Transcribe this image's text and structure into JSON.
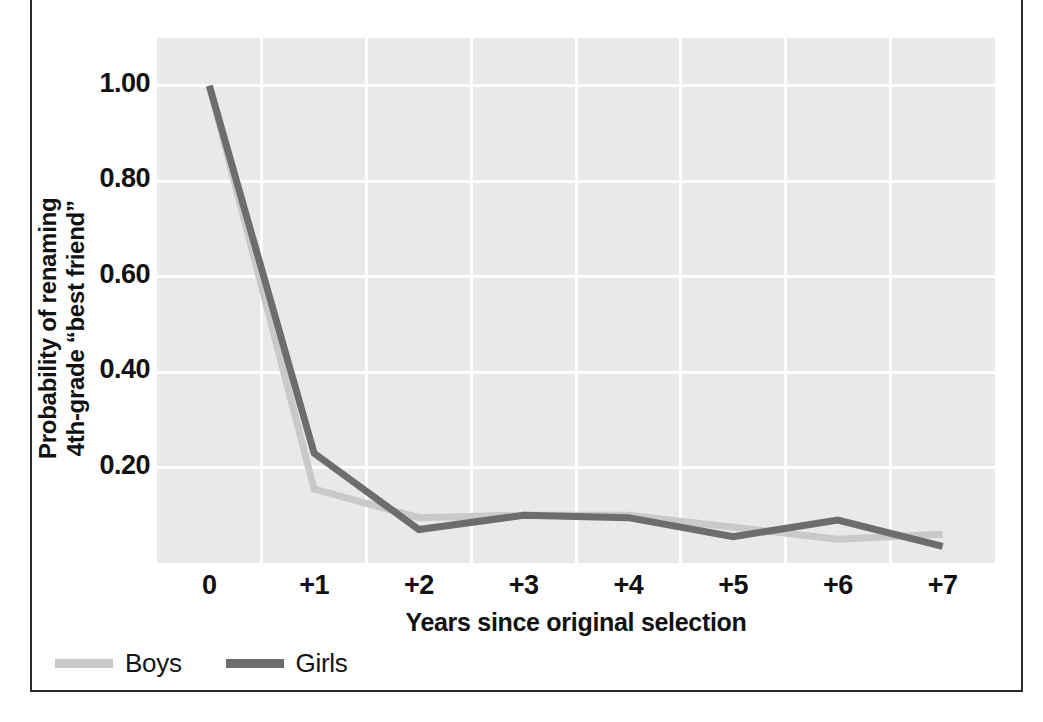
{
  "chart_data": {
    "type": "line",
    "title": "",
    "xlabel": "Years since original selection",
    "ylabel": "Probability of renaming 4th-grade “best friend”",
    "ylabel_lines": [
      "Probability of renaming",
      "4th-grade “best friend”"
    ],
    "categories": [
      "0",
      "+1",
      "+2",
      "+3",
      "+4",
      "+5",
      "+6",
      "+7"
    ],
    "x": [
      0,
      1,
      2,
      3,
      4,
      5,
      6,
      7
    ],
    "xtick_labels": [
      "0",
      "+1",
      "+2",
      "+3",
      "+4",
      "+5",
      "+6",
      "+7"
    ],
    "ytick_labels": [
      "1.00",
      "0.80",
      "0.60",
      "0.40",
      "0.20"
    ],
    "ytick_values": [
      1.0,
      0.8,
      0.6,
      0.4,
      0.2
    ],
    "ylim": [
      0.0,
      1.1
    ],
    "xlim": [
      -0.5,
      7.5
    ],
    "grid": true,
    "grid_color": "#ffffff",
    "plot_background": "#e9e9e9",
    "legend_position": "below-left",
    "series": [
      {
        "name": "Boys",
        "color": "#c9c9c9",
        "values": [
          1.0,
          0.155,
          0.095,
          0.1,
          0.1,
          0.075,
          0.05,
          0.06
        ]
      },
      {
        "name": "Girls",
        "color": "#6d6d6d",
        "values": [
          1.0,
          0.23,
          0.07,
          0.1,
          0.095,
          0.055,
          0.09,
          0.035
        ]
      }
    ]
  },
  "legend": {
    "items": [
      {
        "label": "Boys",
        "color": "#c9c9c9"
      },
      {
        "label": "Girls",
        "color": "#6d6d6d"
      }
    ]
  },
  "colors": {
    "boys": "#c9c9c9",
    "girls": "#6d6d6d",
    "panel": "#e9e9e9",
    "grid": "#ffffff",
    "text": "#111111",
    "frame": "#2b2b2b"
  }
}
